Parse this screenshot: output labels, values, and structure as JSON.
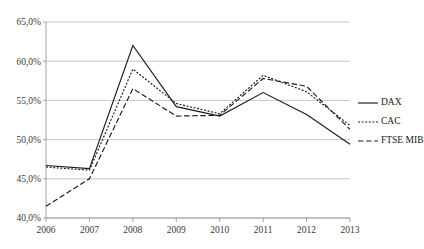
{
  "chart_data": {
    "type": "line",
    "title": "",
    "subtitle": "",
    "xlabel": "",
    "ylabel": "",
    "categories": [
      "2006",
      "2007",
      "2008",
      "2009",
      "2010",
      "2011",
      "2012",
      "2013"
    ],
    "x": [
      2006,
      2007,
      2008,
      2009,
      2010,
      2011,
      2012,
      2013
    ],
    "series": [
      {
        "name": "DAX",
        "style": "solid",
        "color": "#1c1c1c",
        "values": [
          46.7,
          46.3,
          62.0,
          54.2,
          53.0,
          56.0,
          53.2,
          49.4
        ]
      },
      {
        "name": "CAC",
        "style": "dotted",
        "color": "#1c1c1c",
        "values": [
          46.5,
          46.1,
          59.0,
          54.6,
          53.3,
          58.2,
          56.1,
          51.8
        ]
      },
      {
        "name": "FTSE MIB",
        "style": "dashed",
        "color": "#1c1c1c",
        "values": [
          41.5,
          45.0,
          56.5,
          53.0,
          53.1,
          57.8,
          56.8,
          51.3
        ]
      }
    ],
    "ylim": [
      40.0,
      65.0
    ],
    "ytick_values": [
      40.0,
      45.0,
      50.0,
      55.0,
      60.0,
      65.0
    ],
    "ytick_labels": [
      "40,0%",
      "45,0%",
      "50,0%",
      "55,0%",
      "60,0%",
      "65,0%"
    ],
    "xtick_labels": [
      "2006",
      "2007",
      "2008",
      "2009",
      "2010",
      "2011",
      "2012",
      "2013"
    ],
    "grid": true,
    "grid_axis": "y",
    "legend_position": "right",
    "legend_entries": [
      "DAX",
      "CAC",
      "FTSE MIB"
    ],
    "annotations": [],
    "decimal_separator": ",",
    "value_unit": "%"
  },
  "colors": {
    "background": "#ffffff",
    "line": "#1c1c1c",
    "grid": "#b8b8b8",
    "axis": "#9a9a9a",
    "tick_label": "#3a3a3a",
    "legend_label": "#1a1a1a"
  },
  "legend": {
    "items": [
      {
        "label": "DAX",
        "dash": "none"
      },
      {
        "label": "CAC",
        "dash": "2,1.6"
      },
      {
        "label": "FTSE MIB",
        "dash": "5.5,2.6"
      }
    ]
  }
}
